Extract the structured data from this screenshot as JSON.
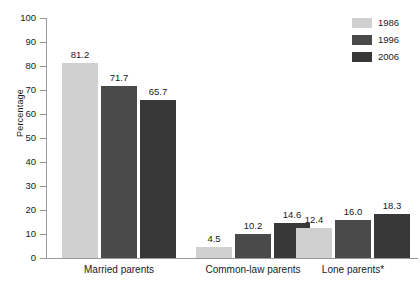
{
  "chart_data": {
    "type": "bar",
    "title": "",
    "xlabel": "",
    "ylabel": "Percentage",
    "ylim": [
      0,
      100
    ],
    "ytick_step": 10,
    "yticks": [
      100,
      90,
      80,
      70,
      60,
      50,
      40,
      30,
      20,
      10,
      0
    ],
    "grid": false,
    "legend_position": "top-right",
    "categories": [
      "Married parents",
      "Common-law parents",
      "Lone parents*"
    ],
    "series": [
      {
        "name": "1986",
        "color": "#d0d0d0",
        "values": [
          81.2,
          4.5,
          12.4
        ],
        "labels": [
          "81.2",
          "4.5",
          "12.4"
        ]
      },
      {
        "name": "1996",
        "color": "#4a4a4a",
        "values": [
          71.7,
          10.2,
          16.0
        ],
        "labels": [
          "71.7",
          "10.2",
          "16.0"
        ]
      },
      {
        "name": "2006",
        "color": "#383838",
        "values": [
          65.7,
          14.6,
          18.3
        ],
        "labels": [
          "65.7",
          "14.6",
          "18.3"
        ]
      }
    ]
  },
  "axis": {
    "y_title": "Percentage",
    "tick_labels": [
      "100",
      "90",
      "80",
      "70",
      "60",
      "50",
      "40",
      "30",
      "20",
      "10",
      "0"
    ]
  },
  "legend": {
    "entries": [
      {
        "label": "1986",
        "color": "#d0d0d0"
      },
      {
        "label": "1996",
        "color": "#4a4a4a"
      },
      {
        "label": "2006",
        "color": "#383838"
      }
    ]
  },
  "groups": [
    {
      "label": "Married parents"
    },
    {
      "label": "Common-law parents"
    },
    {
      "label": "Lone parents*"
    }
  ],
  "colors": {
    "axis": "#9a9a9a",
    "text": "#1a1a1a",
    "background": "#ffffff",
    "series_1986": "#d0d0d0",
    "series_1996": "#4a4a4a",
    "series_2006": "#383838"
  }
}
